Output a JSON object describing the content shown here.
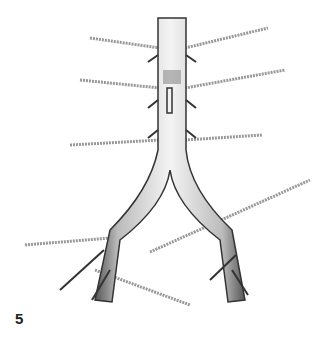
{
  "figure": {
    "number": "5"
  }
}
